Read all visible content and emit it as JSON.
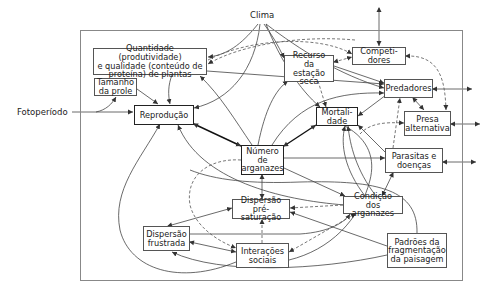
{
  "diagram": {
    "external": {
      "clima": "Clima",
      "fotoperiodo": "Fotoperíodo"
    },
    "nodes": {
      "quantidade": "Quantidade (produtividade)\ne qualidade (conteúdo de\nproteína) de plantas",
      "tamanho_prole": "Tamanho\nda prole",
      "reproducao": "Reprodução",
      "recurso": "Recurso\nda estação\nseca",
      "competidores": "Competi-\ndores",
      "predadores": "Predadores",
      "mortalidade": "Mortali-\ndade",
      "presa_alternativa": "Presa\nalternativa",
      "numero_arganazes": "Número\nde\narganazes",
      "parasitas": "Parasitas e\ndoenças",
      "dispersao_pre": "Dispersão\npré-saturação",
      "condicao": "Condição dos\narganazes",
      "dispersao_frustrada": "Dispersão\nfrustrada",
      "interacoes": "Interações\nsociais",
      "padroes": "Padrões da\nfragmentação\nda paisagem"
    },
    "edge_styles": {
      "solid": "#444444",
      "dashed": "#555555",
      "bold": "#111111"
    }
  }
}
